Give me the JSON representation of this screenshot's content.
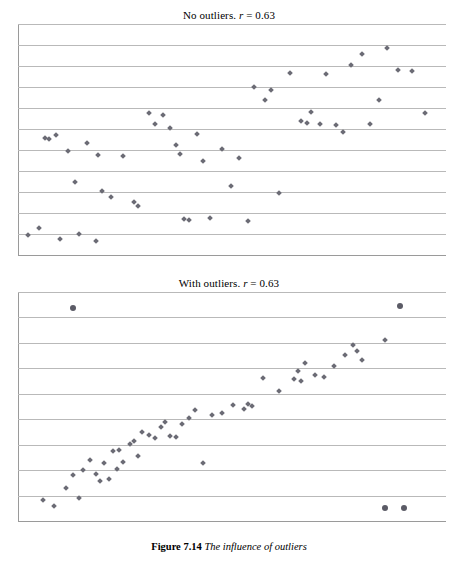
{
  "caption": {
    "label": "Figure 7.14",
    "text": "The influence of outliers"
  },
  "chart_data": [
    {
      "type": "scatter",
      "title": "No outliers. r = 0.63",
      "title_prefix": "No outliers. ",
      "title_stat_symbol": "r",
      "title_stat_value": " = 0.63",
      "xlabel": "",
      "ylabel": "",
      "grid": true,
      "gridlines": 11,
      "xlim": [
        0,
        100
      ],
      "ylim": [
        0,
        100
      ],
      "legend": "none",
      "points": [
        [
          1.5,
          8.0
        ],
        [
          4.0,
          11.0
        ],
        [
          5.5,
          51.0
        ],
        [
          6.5,
          50.5
        ],
        [
          8.0,
          52.0
        ],
        [
          9.0,
          6.0
        ],
        [
          11.0,
          45.0
        ],
        [
          12.5,
          31.5
        ],
        [
          13.5,
          8.5
        ],
        [
          15.5,
          48.5
        ],
        [
          17.5,
          5.5
        ],
        [
          18.0,
          43.5
        ],
        [
          19.0,
          27.5
        ],
        [
          21.0,
          25.0
        ],
        [
          24.0,
          43.0
        ],
        [
          26.5,
          22.5
        ],
        [
          27.5,
          21.0
        ],
        [
          30.0,
          62.0
        ],
        [
          31.5,
          57.0
        ],
        [
          33.5,
          61.0
        ],
        [
          35.0,
          55.5
        ],
        [
          36.5,
          48.0
        ],
        [
          37.5,
          44.0
        ],
        [
          38.5,
          15.0
        ],
        [
          39.5,
          14.5
        ],
        [
          41.5,
          52.5
        ],
        [
          43.0,
          40.5
        ],
        [
          44.5,
          15.5
        ],
        [
          47.5,
          46.0
        ],
        [
          49.5,
          29.5
        ],
        [
          51.5,
          42.0
        ],
        [
          53.5,
          14.0
        ],
        [
          55.0,
          73.5
        ],
        [
          57.5,
          67.5
        ],
        [
          59.0,
          72.0
        ],
        [
          61.0,
          26.5
        ],
        [
          63.5,
          79.5
        ],
        [
          66.0,
          58.5
        ],
        [
          67.5,
          57.5
        ],
        [
          68.5,
          62.5
        ],
        [
          70.5,
          57.0
        ],
        [
          72.0,
          79.0
        ],
        [
          74.5,
          56.5
        ],
        [
          76.0,
          53.5
        ],
        [
          78.0,
          83.0
        ],
        [
          80.5,
          88.0
        ],
        [
          82.5,
          57.0
        ],
        [
          84.5,
          67.5
        ],
        [
          86.5,
          90.5
        ],
        [
          89.0,
          81.0
        ],
        [
          92.5,
          80.5
        ],
        [
          95.5,
          62.0
        ]
      ]
    },
    {
      "type": "scatter",
      "title": "With outliers. r = 0.63",
      "title_prefix": "With outliers. ",
      "title_stat_symbol": "r",
      "title_stat_value": " = 0.63",
      "xlabel": "",
      "ylabel": "",
      "grid": true,
      "gridlines": 9,
      "xlim": [
        0,
        100
      ],
      "ylim": [
        0,
        100
      ],
      "legend": "none",
      "points": [
        [
          5.0,
          8.5
        ],
        [
          7.5,
          6.0
        ],
        [
          10.5,
          14.0
        ],
        [
          12.0,
          19.5
        ],
        [
          13.5,
          9.5
        ],
        [
          14.5,
          22.0
        ],
        [
          16.0,
          26.5
        ],
        [
          17.5,
          20.0
        ],
        [
          18.5,
          17.0
        ],
        [
          19.5,
          25.0
        ],
        [
          20.5,
          18.0
        ],
        [
          21.5,
          30.5
        ],
        [
          22.5,
          22.5
        ],
        [
          23.0,
          31.0
        ],
        [
          24.0,
          25.5
        ],
        [
          25.5,
          33.5
        ],
        [
          26.5,
          35.0
        ],
        [
          27.5,
          28.0
        ],
        [
          28.5,
          39.0
        ],
        [
          30.0,
          37.5
        ],
        [
          31.5,
          36.0
        ],
        [
          33.0,
          41.0
        ],
        [
          34.0,
          43.5
        ],
        [
          35.0,
          37.0
        ],
        [
          36.5,
          36.5
        ],
        [
          38.0,
          42.5
        ],
        [
          39.5,
          45.0
        ],
        [
          41.0,
          48.5
        ],
        [
          43.0,
          25.0
        ],
        [
          45.0,
          46.5
        ],
        [
          47.5,
          47.5
        ],
        [
          50.0,
          51.0
        ],
        [
          52.5,
          49.0
        ],
        [
          53.5,
          51.5
        ],
        [
          54.5,
          50.5
        ],
        [
          57.0,
          63.0
        ],
        [
          61.0,
          57.0
        ],
        [
          64.5,
          62.5
        ],
        [
          65.5,
          66.0
        ],
        [
          66.0,
          61.5
        ],
        [
          67.0,
          69.5
        ],
        [
          69.5,
          64.5
        ],
        [
          71.5,
          63.5
        ],
        [
          74.0,
          68.5
        ],
        [
          76.5,
          73.0
        ],
        [
          78.5,
          77.5
        ],
        [
          79.5,
          75.0
        ],
        [
          80.5,
          71.0
        ],
        [
          86.0,
          80.0
        ]
      ],
      "outliers": [
        [
          12.0,
          94.0
        ],
        [
          89.5,
          95.0
        ],
        [
          86.0,
          5.0
        ],
        [
          90.5,
          5.0
        ]
      ]
    }
  ]
}
